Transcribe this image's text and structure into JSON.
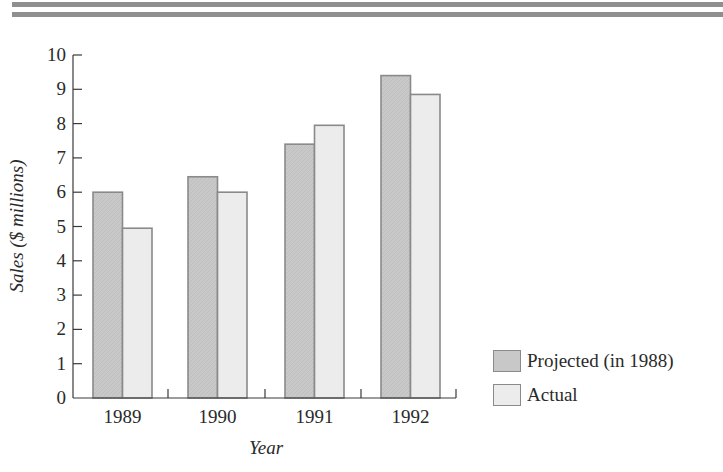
{
  "decor": {
    "top_rules": 2,
    "rule_color": "#8f8f8f"
  },
  "chart_data": {
    "type": "bar",
    "title": "",
    "xlabel": "Year",
    "ylabel": "Sales ($ millions)",
    "categories": [
      "1989",
      "1990",
      "1991",
      "1992"
    ],
    "series": [
      {
        "name": "Projected (in 1988)",
        "values": [
          6.0,
          6.45,
          7.4,
          9.4
        ],
        "color": "#c8c8c8"
      },
      {
        "name": "Actual",
        "values": [
          4.95,
          6.0,
          7.95,
          8.85
        ],
        "color": "#ececec"
      }
    ],
    "ylim": [
      0,
      10
    ],
    "yticks": [
      "0",
      "1",
      "2",
      "3",
      "4",
      "5",
      "6",
      "7",
      "8",
      "9",
      "10"
    ],
    "grid": false,
    "legend_position": "right-bottom",
    "bar_border_color": "#8a8a8a",
    "axis_color": "#3a3a3a"
  }
}
